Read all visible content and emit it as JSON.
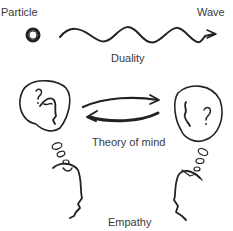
{
  "labels": {
    "particle": "Particle",
    "wave": "Wave",
    "duality": "Duality",
    "theory_of_mind": "Theory of mind",
    "empathy": "Empathy"
  },
  "icons": {
    "particle": "particle-circle",
    "wave": "wave-squiggle-arrow",
    "left_head": "thinking-head-left",
    "right_head": "thinking-head-right",
    "arrows": "bidirectional-arrows",
    "left_profile": "face-profile-left",
    "right_profile": "face-profile-right"
  },
  "colors": {
    "ink": "#222222",
    "text": "#3a3a3a",
    "arrow": "#555555"
  }
}
